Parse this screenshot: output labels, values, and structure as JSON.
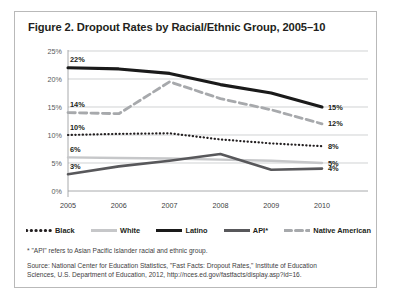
{
  "figure": {
    "title": "Figure 2. Dropout Rates by Racial/Ethnic Group, 2005–10",
    "footnote": "* \"API\" refers to Asian Pacific Islander racial and ethnic group.",
    "source_line_1": "Source: National Center for Education Statistics, \"Fast Facts: Dropout Rates,\" Institute of Education",
    "source_line_2": "Sciences, U.S. Department of Education, 2012, http://nces.ed.gov/fastfacts/display.asp?id=16."
  },
  "legend": {
    "items": [
      {
        "label": "Black",
        "style": "dotted",
        "color": "#231f20"
      },
      {
        "label": "White",
        "style": "solid",
        "color": "#c6c7c9"
      },
      {
        "label": "Latino",
        "style": "solid",
        "color": "#1a1a1a"
      },
      {
        "label": "API*",
        "style": "solid",
        "color": "#58585b"
      },
      {
        "label": "Native American",
        "style": "dashed",
        "color": "#a7a9ac"
      }
    ]
  },
  "chart_data": {
    "type": "line",
    "title": "Figure 2. Dropout Rates by Racial/Ethnic Group, 2005–10",
    "xlabel": "",
    "ylabel": "",
    "x": [
      "2005",
      "2006",
      "2007",
      "2008",
      "2009",
      "2010"
    ],
    "categories": [
      "2005",
      "2006",
      "2007",
      "2008",
      "2009",
      "2010"
    ],
    "ylim": [
      0,
      25
    ],
    "yticks": [
      "0%",
      "5%",
      "10%",
      "15%",
      "20%",
      "25%"
    ],
    "ytick_values": [
      0,
      5,
      10,
      15,
      20,
      25
    ],
    "grid": true,
    "legend_position": "bottom",
    "series": [
      {
        "name": "Latino",
        "color": "#1a1a1a",
        "style": "solid",
        "width": 3.1,
        "values": [
          22.0,
          21.8,
          21.0,
          19.0,
          17.5,
          15.0
        ],
        "start_label": "22%",
        "end_label": "15%"
      },
      {
        "name": "Native American",
        "color": "#a7a9ac",
        "style": "dashed",
        "width": 2.8,
        "values": [
          14.0,
          13.8,
          19.5,
          16.5,
          14.5,
          12.0
        ],
        "start_label": "14%",
        "end_label": "12%"
      },
      {
        "name": "Black",
        "color": "#231f20",
        "style": "dotted",
        "width": 2.2,
        "values": [
          10.0,
          10.2,
          10.3,
          9.2,
          8.5,
          8.0
        ],
        "start_label": "10%",
        "end_label": "8%"
      },
      {
        "name": "White",
        "color": "#c6c7c9",
        "style": "solid",
        "width": 2.4,
        "values": [
          6.0,
          5.9,
          5.8,
          5.6,
          5.4,
          5.0
        ],
        "start_label": "6%",
        "end_label": "5%"
      },
      {
        "name": "API*",
        "color": "#58585b",
        "style": "solid",
        "width": 2.6,
        "values": [
          3.0,
          4.4,
          5.4,
          6.6,
          3.8,
          4.0
        ],
        "start_label": "3%",
        "end_label": "4%"
      }
    ]
  }
}
